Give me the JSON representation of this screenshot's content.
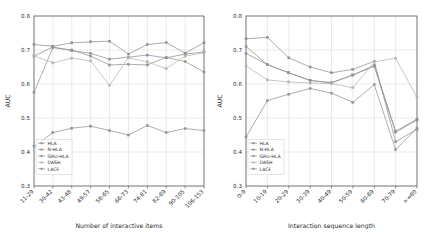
{
  "figure": {
    "ylabel": "AUC",
    "ylim": [
      0.3,
      0.8
    ],
    "yticks": [
      "0.3",
      "0.4",
      "0.5",
      "0.6",
      "0.7",
      "0.8"
    ],
    "legend_labels": [
      "HLA",
      "N-HLA",
      "GRU-HLA",
      "DASH",
      "LACF"
    ],
    "colors": [
      "#8a8f9c",
      "#9a8c93",
      "#9b9288",
      "#b8b4ae",
      "#8e949a"
    ]
  },
  "chart_data": [
    {
      "type": "line",
      "title": "",
      "xlabel": "Number of interactive items",
      "ylabel": "AUC",
      "ylim": [
        0.3,
        0.8
      ],
      "grid": true,
      "legend_position": "lower-left",
      "categories": [
        "11-29",
        "30-42",
        "43-48",
        "49-57",
        "58-65",
        "66-73",
        "74-81",
        "82-89",
        "90-105",
        "106-153"
      ],
      "series": [
        {
          "name": "HLA",
          "values": [
            0.682,
            0.709,
            0.698,
            0.69,
            0.673,
            0.679,
            0.685,
            0.677,
            0.688,
            0.694
          ]
        },
        {
          "name": "N-HLA",
          "values": [
            0.716,
            0.711,
            0.721,
            0.724,
            0.726,
            0.688,
            0.716,
            0.722,
            0.691,
            0.721
          ]
        },
        {
          "name": "GRU-HLA",
          "values": [
            0.575,
            0.707,
            0.7,
            0.682,
            0.656,
            0.658,
            0.656,
            0.678,
            0.666,
            0.635
          ]
        },
        {
          "name": "DASH",
          "values": [
            0.683,
            0.662,
            0.676,
            0.668,
            0.596,
            0.677,
            0.665,
            0.645,
            0.682,
            0.692
          ]
        },
        {
          "name": "LACF",
          "values": [
            0.417,
            0.457,
            0.47,
            0.476,
            0.463,
            0.45,
            0.478,
            0.457,
            0.469,
            0.463
          ]
        }
      ]
    },
    {
      "type": "line",
      "title": "",
      "xlabel": "Interaction sequence length",
      "ylabel": "AUC",
      "ylim": [
        0.3,
        0.8
      ],
      "grid": true,
      "legend_position": "lower-left",
      "categories": [
        "0-9",
        "10-19",
        "20-29",
        "30-39",
        "40-49",
        "50-59",
        "60-69",
        "70-79",
        ">=80"
      ],
      "series": [
        {
          "name": "HLA",
          "values": [
            0.69,
            0.657,
            0.633,
            0.61,
            0.604,
            0.626,
            0.655,
            0.461,
            0.497
          ]
        },
        {
          "name": "N-HLA",
          "values": [
            0.733,
            0.737,
            0.677,
            0.65,
            0.633,
            0.643,
            0.667,
            0.43,
            0.467
          ]
        },
        {
          "name": "GRU-HLA",
          "values": [
            0.71,
            0.657,
            0.633,
            0.611,
            0.603,
            0.627,
            0.652,
            0.458,
            0.494
          ]
        },
        {
          "name": "DASH",
          "values": [
            0.653,
            0.612,
            0.606,
            0.603,
            0.601,
            0.589,
            0.665,
            0.676,
            0.561
          ]
        },
        {
          "name": "LACF",
          "values": [
            0.444,
            0.551,
            0.57,
            0.587,
            0.573,
            0.546,
            0.598,
            0.407,
            0.47
          ]
        }
      ]
    }
  ]
}
